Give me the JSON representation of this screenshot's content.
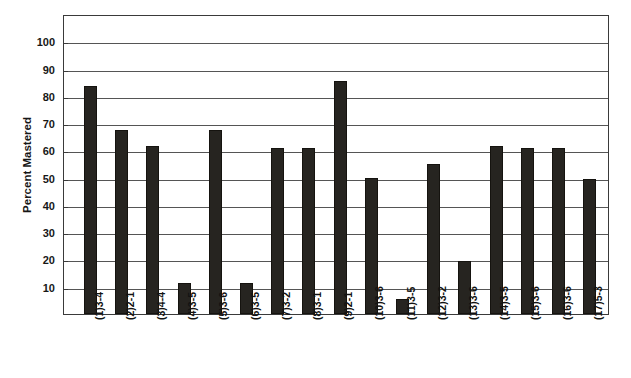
{
  "chart_data": {
    "type": "bar",
    "title": "",
    "subtitle": "",
    "xlabel": "",
    "ylabel": "Percent Mastered",
    "ylim": [
      0,
      110
    ],
    "ytick_labels": [
      "10",
      "20",
      "30",
      "40",
      "50",
      "60",
      "70",
      "80",
      "90",
      "100"
    ],
    "yticks": [
      10,
      20,
      30,
      40,
      50,
      60,
      70,
      80,
      90,
      100
    ],
    "grid": true,
    "legend": false,
    "legend_position": "none",
    "bar_color": "#262420",
    "categories": [
      "(1)3-4",
      "(2)2-1",
      "(3)4-4",
      "(4)3-5",
      "(5)3-6",
      "(6)3-5",
      "(7)3-2",
      "(8)3-1",
      "(9)2-1",
      "(10)3-6",
      "(11)3-5",
      "(12)3-2",
      "(13)3-6",
      "(14)3-5",
      "(15)3-6",
      "(16)3-6",
      "(17)5-3"
    ],
    "values": [
      83.5,
      67.5,
      61.5,
      11.5,
      67.5,
      11.5,
      61,
      61,
      85.5,
      50,
      5.5,
      55,
      19.5,
      61.5,
      61,
      61,
      49.5
    ]
  },
  "axes": {
    "y_title": "Percent Mastered"
  }
}
